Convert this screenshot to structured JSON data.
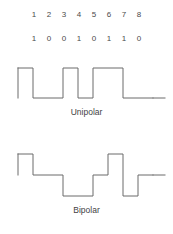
{
  "figure": {
    "title": "",
    "width": 173,
    "height": 234,
    "background": "#ffffff",
    "line_color": "#6b6b6b",
    "text_color": "#3f3f3f"
  },
  "bit_index_row": {
    "name": "bit-position-numbers",
    "cells": [
      "1",
      "2",
      "3",
      "4",
      "5",
      "6",
      "7",
      "8"
    ]
  },
  "bit_value_row": {
    "name": "bit-values",
    "cells": [
      "1",
      "0",
      "0",
      "1",
      "0",
      "1",
      "1",
      "0"
    ]
  },
  "waveforms": [
    {
      "id": "unipolar",
      "label": "Unipolar",
      "type": "two-level",
      "levels": [
        "high",
        "low"
      ],
      "bits": [
        "1",
        "0",
        "0",
        "1",
        "0",
        "1",
        "1",
        "0"
      ],
      "level_sequence": [
        "high",
        "low",
        "low",
        "high",
        "low",
        "high",
        "high",
        "low"
      ],
      "points": "18,6 33,6 33,36 63,36 63,6 78,6 78,36 93,36 93,6 123,6 123,36 153,36",
      "lead_in": "18,6 18,36",
      "tail": "153,36 165,36"
    },
    {
      "id": "bipolar",
      "label": "Bipolar",
      "type": "three-level",
      "levels": [
        "high",
        "mid",
        "low"
      ],
      "bits": [
        "1",
        "0",
        "0",
        "1",
        "0",
        "1",
        "1",
        "0"
      ],
      "level_sequence": [
        "high",
        "mid",
        "mid",
        "low",
        "low",
        "mid",
        "high",
        "mid"
      ],
      "points": "18,6 33,6 33,27 63,27 63,48 93,48 93,27 108,27 108,6 123,6 123,48 138,48 138,27 153,27",
      "lead_in": "18,6 18,27",
      "tail": "153,27 165,27"
    }
  ],
  "chart_data": {
    "type": "line",
    "title": "",
    "xlabel": "",
    "ylabel": "",
    "categories": [
      "1",
      "2",
      "3",
      "4",
      "5",
      "6",
      "7",
      "8"
    ],
    "bitstream": [
      1,
      0,
      0,
      1,
      0,
      1,
      1,
      0
    ],
    "series": [
      {
        "name": "Unipolar",
        "encoding": "two-level NRZ; 1 = high, 0 = zero",
        "values": [
          1,
          0,
          0,
          1,
          0,
          1,
          1,
          0
        ],
        "ylim": [
          0,
          1
        ]
      },
      {
        "name": "Bipolar",
        "encoding": "three-level; alternating polarity staircase",
        "values": [
          1,
          0,
          0,
          -1,
          -1,
          0,
          1,
          0
        ],
        "ylim": [
          -1,
          1
        ]
      }
    ],
    "grid": false,
    "legend": "none"
  }
}
